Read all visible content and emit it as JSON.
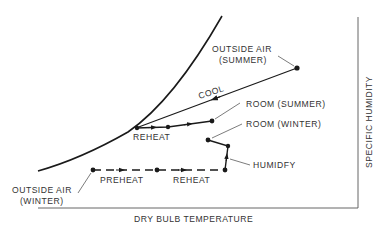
{
  "diagram": {
    "type": "psychrometric-process-diagram",
    "axes": {
      "x_label": "DRY BULB TEMPERATURE",
      "y_label": "SPECIFIC HUMIDITY"
    },
    "labels": {
      "outside_air_summer_line1": "OUTSIDE AIR",
      "outside_air_summer_line2": "(SUMMER)",
      "cool": "COOL",
      "room_summer": "ROOM (SUMMER)",
      "room_winter": "ROOM (WINTER)",
      "reheat_summer": "REHEAT",
      "humidify": "HUMIDFY",
      "preheat": "PREHEAT",
      "reheat_winter": "REHEAT",
      "outside_air_winter_line1": "OUTSIDE AIR",
      "outside_air_winter_line2": "(WINTER)"
    },
    "points": {
      "outside_air_summer": [
        297,
        68
      ],
      "cooling_saturation": [
        136,
        128
      ],
      "reheat_summer_point": [
        168,
        127
      ],
      "room_summer": [
        212,
        121
      ],
      "room_winter": [
        208,
        140
      ],
      "humidify_top": [
        228,
        146
      ],
      "humidify_bottom": [
        225,
        170
      ],
      "preheat_end": [
        157,
        170
      ],
      "outside_air_winter": [
        93,
        170
      ]
    },
    "colors": {
      "line": "#1a1a1a",
      "text": "#333333",
      "axis": "#555555"
    }
  }
}
